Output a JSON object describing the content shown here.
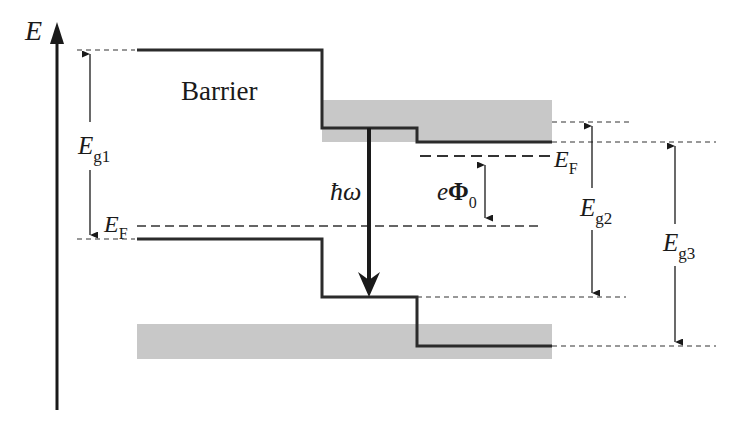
{
  "diagram": {
    "type": "band-diagram",
    "axis_label": "E",
    "region_label": "Barrier",
    "labels": {
      "eg1_main": "E",
      "eg1_sub": "g1",
      "eg2_main": "E",
      "eg2_sub": "g2",
      "eg3_main": "E",
      "eg3_sub": "g3",
      "ef_left_main": "E",
      "ef_left_sub": "F",
      "ef_right_main": "E",
      "ef_right_sub": "F",
      "phi_prefix": "e",
      "phi_symbol": "Φ",
      "phi_sub": "0",
      "photon": "ħω"
    },
    "colors": {
      "band_line": "#2b2b2b",
      "shade": "#c8c8c8",
      "dash": "#333333",
      "arrow": "#1a1a1a"
    }
  }
}
